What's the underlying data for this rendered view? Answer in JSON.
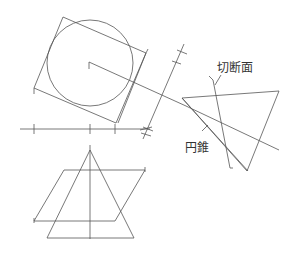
{
  "diagram": {
    "title": "",
    "labels": {
      "cutting_plane": "切断面",
      "cone": "円錐"
    },
    "colors": {
      "line": "#555555",
      "text": "#333333",
      "background": "#ffffff"
    },
    "elements": {
      "top_view": {
        "circle": {
          "cx": 90,
          "cy": 63,
          "r": 43
        },
        "enclosing_square": [
          [
            63,
            17
          ],
          [
            146,
            53
          ],
          [
            116,
            123
          ],
          [
            34,
            88
          ]
        ]
      },
      "ground_line": {
        "y": 129,
        "x_from": 20,
        "x_to": 150,
        "ticks_x": [
          34,
          90,
          115
        ]
      },
      "projection_axis": {
        "from": [
          185,
          44
        ],
        "to": [
          143,
          138
        ]
      },
      "side_view_cone": {
        "vertices": [
          [
            182,
            98
          ],
          [
            279,
            91
          ],
          [
            247,
            171
          ]
        ]
      },
      "cutting_plane_line": {
        "from": [
          212,
          78
        ],
        "to": [
          230,
          168
        ]
      },
      "front_view": {
        "cone_triangle": [
          [
            90,
            150
          ],
          [
            47,
            238
          ],
          [
            134,
            238
          ]
        ],
        "axis": {
          "x": 90,
          "y_from": 145,
          "y_to": 238
        },
        "cutting_plane_parallelogram": [
          [
            64,
            170
          ],
          [
            145,
            170
          ],
          [
            115,
            221
          ],
          [
            34,
            221
          ]
        ]
      }
    }
  }
}
